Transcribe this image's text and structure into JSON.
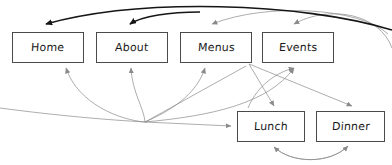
{
  "diagram": {
    "type": "site-map-flow",
    "background_color": "#ffffff",
    "stroke_color_thin": "#8a8a8a",
    "stroke_color_bold": "#151515",
    "box_border_color": "#4a4a4a",
    "text_color": "#1a1a1a",
    "nodes": [
      {
        "id": "home",
        "label": "Home",
        "x": 12,
        "y": 32,
        "w": 72,
        "h": 31
      },
      {
        "id": "about",
        "label": "About",
        "x": 96,
        "y": 32,
        "w": 72,
        "h": 31
      },
      {
        "id": "menus",
        "label": "Menus",
        "x": 180,
        "y": 32,
        "w": 72,
        "h": 31
      },
      {
        "id": "events",
        "label": "Events",
        "x": 262,
        "y": 32,
        "w": 72,
        "h": 31
      },
      {
        "id": "lunch",
        "label": "Lunch",
        "x": 237,
        "y": 111,
        "w": 68,
        "h": 31
      },
      {
        "id": "dinner",
        "label": "Dinner",
        "x": 316,
        "y": 111,
        "w": 69,
        "h": 31
      }
    ],
    "edges": [
      {
        "from": "top-arc-right",
        "to": "home",
        "style": "bold"
      },
      {
        "from": "top-arc",
        "to": "about",
        "style": "bold"
      },
      {
        "from": "top-arc-right",
        "to": "menus",
        "style": "thin"
      },
      {
        "from": "top-arc-right",
        "to": "events",
        "style": "thin"
      },
      {
        "from": "hub",
        "to": "home",
        "style": "thin"
      },
      {
        "from": "hub",
        "to": "about",
        "style": "thin"
      },
      {
        "from": "hub",
        "to": "menus",
        "style": "thin"
      },
      {
        "from": "hub",
        "to": "events",
        "style": "thin"
      },
      {
        "from": "hub",
        "to": "lunch",
        "style": "thin"
      },
      {
        "from": "menus",
        "to": "lunch",
        "style": "thin"
      },
      {
        "from": "menus",
        "to": "dinner",
        "style": "thin"
      },
      {
        "from": "lunch",
        "to": "menus",
        "style": "thin"
      },
      {
        "from": "lunch",
        "to": "dinner",
        "style": "thin"
      },
      {
        "from": "dinner",
        "to": "lunch",
        "style": "thin"
      }
    ]
  }
}
